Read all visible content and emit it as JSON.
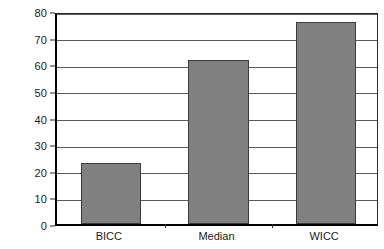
{
  "chart_data": {
    "type": "bar",
    "title": "",
    "subtitle": "",
    "xlabel": "",
    "ylabel": "Days",
    "categories": [
      "BICC",
      "Median",
      "WICC"
    ],
    "values": [
      23,
      61.5,
      76
    ],
    "series": [
      {
        "name": "Days",
        "values": [
          23,
          61.5,
          76
        ]
      }
    ],
    "ylim": [
      0,
      80
    ],
    "y_ticks": [
      0,
      10,
      20,
      30,
      40,
      50,
      60,
      70,
      80
    ],
    "y_tick_labels": [
      "0",
      "10",
      "20",
      "30",
      "40",
      "50",
      "60",
      "70",
      "80"
    ],
    "grid": true,
    "grid_axis": "y",
    "legend": false,
    "legend_position": "none",
    "annotations": [],
    "bar_color": "#808080",
    "bar_edge_color": "#3d3d3d",
    "axis_color": "#000000",
    "grid_color": "#5a5a5a",
    "background_color": "#ffffff"
  }
}
